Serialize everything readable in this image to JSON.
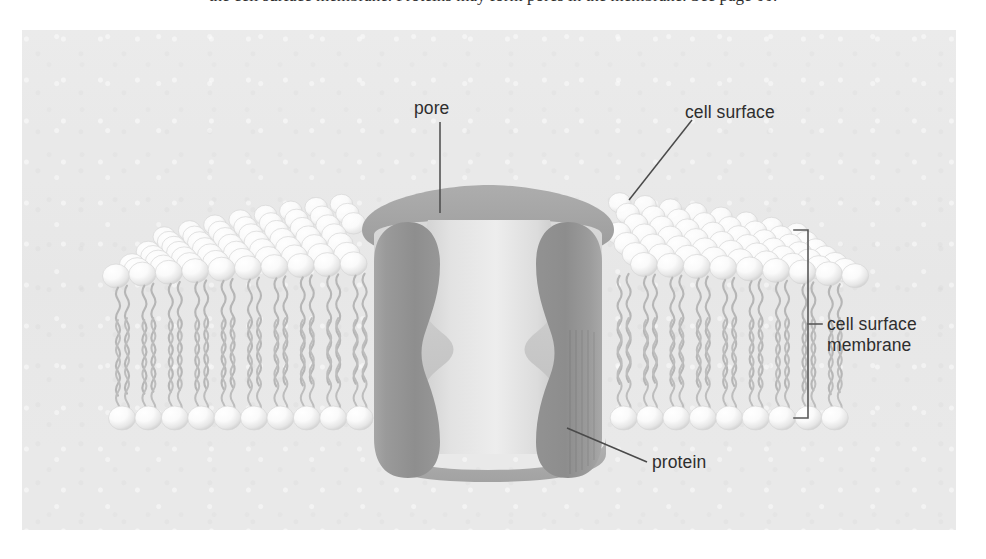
{
  "figure": {
    "title_sliver": "the cell surface membrane. Proteins may form pores in the membrane. See page 00.",
    "panel_bg": "#e9e9e9",
    "labels": {
      "pore": "pore",
      "cell_surface": "cell surface",
      "cell_surface_membrane": "cell surface\nmembrane",
      "cell_surface_membrane_line1": "cell surface",
      "cell_surface_membrane_line2": "membrane",
      "protein": "protein"
    },
    "colors": {
      "background": "#e9e9e9",
      "phospholipid_head": "#fbfbfb",
      "phospholipid_head_shadow": "#d2d2d2",
      "phospholipid_tail": "#b4b4b4",
      "protein_dark": "#8e8e8e",
      "protein_mid": "#a3a3a3",
      "protein_light": "#d7d7d7",
      "pore_fill": "#e4e4e4",
      "leader_line": "#4a4a4a",
      "bracket": "#555555",
      "text": "#2e2e2e"
    },
    "structure": {
      "bilayer_type": "phospholipid bilayer",
      "upper_leaflet_rows": 7,
      "lower_leaflet_rows": 1,
      "tails_per_lipid": 2,
      "channel_protein_count": 1,
      "pore_shape": "hourglass"
    }
  }
}
